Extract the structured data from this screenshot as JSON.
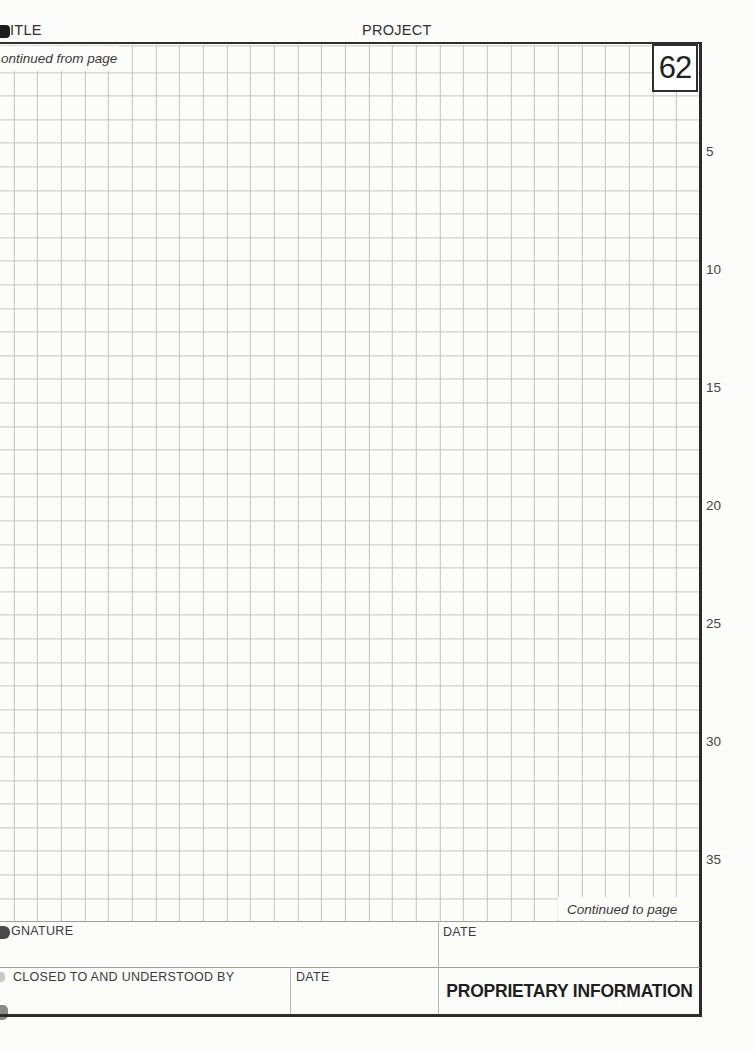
{
  "document": {
    "page_number": "62",
    "header": {
      "title_label": "ITLE",
      "project_label": "PROJECT"
    },
    "grid": {
      "continued_from_label": "ontinued from page",
      "continued_to_label": "Continued to page",
      "row_labels": [
        "5",
        "10",
        "15",
        "20",
        "25",
        "30",
        "35"
      ]
    },
    "footer": {
      "signature_label": "GNATURE",
      "signature_date_label": "DATE",
      "disclosed_label": "CLOSED TO AND UNDERSTOOD BY",
      "disclosed_date_label": "DATE",
      "proprietary_label": "PROPRIETARY INFORMATION"
    },
    "colors": {
      "paper": "#fcfcfb",
      "grid_line": "#c2c2c2",
      "border_dark": "#2e2e2e",
      "rule_light": "#9e9e9e",
      "text": "#333333"
    }
  }
}
